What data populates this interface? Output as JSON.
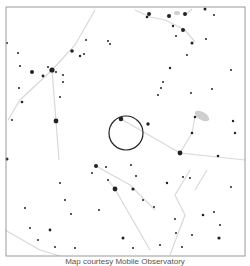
{
  "caption": "Map courtesy Mobile Observatory",
  "map": {
    "frame": {
      "x": 6,
      "y": 7,
      "w": 239,
      "h": 249,
      "color": "#9a9a9a"
    },
    "target_circle": {
      "cx": 126,
      "cy": 133,
      "r": 17,
      "color": "#222222"
    },
    "line_color": "#d8d8d8",
    "star_color": "#222222",
    "nebula_color": "#cfcfcf"
  },
  "stars": [
    [
      149,
      14,
      2
    ],
    [
      169,
      16,
      2
    ],
    [
      185,
      14,
      2
    ],
    [
      205,
      9,
      1.5
    ],
    [
      183,
      30,
      2
    ],
    [
      147,
      17,
      1.3
    ],
    [
      173,
      26,
      1.2
    ],
    [
      214,
      15,
      1
    ],
    [
      192,
      43,
      1.5
    ],
    [
      176,
      36,
      1
    ],
    [
      52,
      70,
      2.6
    ],
    [
      32,
      72,
      2
    ],
    [
      43,
      76,
      1.4
    ],
    [
      48,
      67,
      1
    ],
    [
      56,
      72,
      1
    ],
    [
      63,
      75,
      1
    ],
    [
      72,
      51,
      1.8
    ],
    [
      80,
      56,
      1.2
    ],
    [
      86,
      40,
      1
    ],
    [
      110,
      44,
      1
    ],
    [
      56,
      121,
      2.4
    ],
    [
      19,
      88,
      1
    ],
    [
      22,
      102,
      1.3
    ],
    [
      60,
      97,
      1
    ],
    [
      63,
      82,
      1
    ],
    [
      108,
      41,
      1
    ],
    [
      84,
      54,
      1
    ],
    [
      20,
      66,
      1
    ],
    [
      7,
      43,
      1
    ],
    [
      18,
      53,
      1
    ],
    [
      121,
      119,
      2.3
    ],
    [
      148,
      124,
      1.7
    ],
    [
      163,
      82,
      1
    ],
    [
      161,
      88,
      1
    ],
    [
      170,
      68,
      1.2
    ],
    [
      158,
      95,
      1
    ],
    [
      191,
      93,
      1
    ],
    [
      212,
      89,
      1
    ],
    [
      231,
      70,
      1
    ],
    [
      180,
      153,
      2.4
    ],
    [
      195,
      117,
      1.3
    ],
    [
      192,
      133,
      1.3
    ],
    [
      218,
      156,
      1.3
    ],
    [
      233,
      121,
      1.2
    ],
    [
      235,
      133,
      1.2
    ],
    [
      187,
      55,
      1
    ],
    [
      206,
      39,
      1
    ],
    [
      115,
      189,
      2.4
    ],
    [
      96,
      166,
      2
    ],
    [
      133,
      189,
      1.6
    ],
    [
      108,
      180,
      1
    ],
    [
      106,
      167,
      1
    ],
    [
      7,
      159,
      1.5
    ],
    [
      60,
      183,
      1
    ],
    [
      65,
      200,
      1
    ],
    [
      50,
      230,
      1.4
    ],
    [
      219,
      238,
      1.6
    ],
    [
      123,
      238,
      1.5
    ],
    [
      133,
      248,
      1
    ],
    [
      167,
      183,
      1.2
    ],
    [
      175,
      219,
      1
    ],
    [
      183,
      177,
      1
    ],
    [
      190,
      178,
      1
    ],
    [
      203,
      215,
      1.3
    ],
    [
      214,
      212,
      1
    ],
    [
      220,
      225,
      1
    ],
    [
      231,
      187,
      1
    ],
    [
      154,
      207,
      1
    ],
    [
      131,
      165,
      1
    ],
    [
      182,
      247,
      1
    ],
    [
      192,
      235,
      1
    ],
    [
      99,
      210,
      1
    ],
    [
      92,
      173,
      1
    ],
    [
      71,
      214,
      1
    ],
    [
      25,
      208,
      1
    ],
    [
      30,
      228,
      1
    ],
    [
      38,
      240,
      1
    ],
    [
      12,
      120,
      1
    ],
    [
      136,
      176,
      1
    ],
    [
      143,
      200,
      1
    ],
    [
      160,
      245,
      1
    ],
    [
      176,
      233,
      1
    ],
    [
      55,
      247,
      1
    ],
    [
      75,
      248,
      1
    ]
  ],
  "lines": [
    [
      [
        52,
        70
      ],
      [
        20,
        100
      ],
      [
        8,
        120
      ]
    ],
    [
      [
        52,
        70
      ],
      [
        56,
        121
      ],
      [
        59,
        160
      ]
    ],
    [
      [
        52,
        70
      ],
      [
        75,
        45
      ],
      [
        95,
        10
      ]
    ],
    [
      [
        121,
        119
      ],
      [
        180,
        153
      ],
      [
        245,
        160
      ]
    ],
    [
      [
        135,
        10
      ],
      [
        150,
        17
      ],
      [
        165,
        20
      ],
      [
        185,
        30
      ],
      [
        195,
        42
      ]
    ],
    [
      [
        185,
        15
      ],
      [
        192,
        9
      ]
    ],
    [
      [
        195,
        117
      ],
      [
        192,
        133
      ],
      [
        180,
        153
      ]
    ],
    [
      [
        96,
        166
      ],
      [
        130,
        185
      ],
      [
        155,
        210
      ]
    ],
    [
      [
        108,
        180
      ],
      [
        115,
        189
      ],
      [
        150,
        250
      ]
    ],
    [
      [
        190,
        170
      ],
      [
        175,
        195
      ],
      [
        185,
        215
      ],
      [
        170,
        255
      ]
    ],
    [
      [
        5,
        230
      ],
      [
        40,
        250
      ],
      [
        60,
        256
      ]
    ],
    [
      [
        207,
        170
      ],
      [
        195,
        190
      ]
    ]
  ],
  "nebulae": [
    {
      "cx": 202,
      "cy": 116,
      "rx": 8,
      "ry": 4,
      "rot": 30
    },
    {
      "cx": 177,
      "cy": 13,
      "rx": 3,
      "ry": 2,
      "rot": 0
    }
  ]
}
